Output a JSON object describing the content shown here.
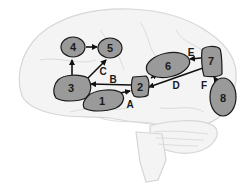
{
  "diagram": {
    "type": "brain-network",
    "colors": {
      "region_fill": "#9a9a9a",
      "region_stroke": "#1a1a1a",
      "brain_fill": "#f4f4f4",
      "brain_stroke": "#d6d6d6",
      "arrow": "#111111"
    },
    "regions": [
      {
        "id": "1",
        "label": "1"
      },
      {
        "id": "2",
        "label": "2"
      },
      {
        "id": "3",
        "label": "3"
      },
      {
        "id": "4",
        "label": "4"
      },
      {
        "id": "5",
        "label": "5"
      },
      {
        "id": "6",
        "label": "6"
      },
      {
        "id": "7",
        "label": "7"
      },
      {
        "id": "8",
        "label": "8"
      }
    ],
    "connections": [
      {
        "label": "A",
        "from": "1",
        "to": "2"
      },
      {
        "label": "B",
        "from": "2",
        "to": "3"
      },
      {
        "label": "C",
        "from": "3",
        "to": "5"
      },
      {
        "label": "",
        "from": "3",
        "to": "4"
      },
      {
        "label": "",
        "from": "4",
        "to": "5"
      },
      {
        "label": "D",
        "from": "7",
        "to": "2"
      },
      {
        "label": "",
        "from": "2",
        "to": "6"
      },
      {
        "label": "E",
        "from": "7",
        "to": "6"
      },
      {
        "label": "F",
        "from": "8",
        "to": "7"
      }
    ]
  }
}
